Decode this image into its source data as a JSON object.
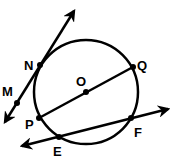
{
  "diagram": {
    "type": "circle-geometry",
    "circle": {
      "center": "O",
      "cx": 86,
      "cy": 92,
      "r": 52
    },
    "points": [
      {
        "id": "N",
        "label": "N",
        "x": 40,
        "y": 65,
        "lx": 24,
        "ly": 70
      },
      {
        "id": "M",
        "label": "M",
        "x": 17,
        "y": 103,
        "lx": 2,
        "ly": 96
      },
      {
        "id": "O",
        "label": "O",
        "x": 86,
        "y": 92,
        "lx": 76,
        "ly": 86
      },
      {
        "id": "Q",
        "label": "Q",
        "x": 133,
        "y": 67,
        "lx": 137,
        "ly": 70
      },
      {
        "id": "P",
        "label": "P",
        "x": 39,
        "y": 118,
        "lx": 25,
        "ly": 129
      },
      {
        "id": "E",
        "label": "E",
        "x": 59,
        "y": 137,
        "lx": 53,
        "ly": 156
      },
      {
        "id": "F",
        "label": "F",
        "x": 131,
        "y": 118,
        "lx": 134,
        "ly": 137
      }
    ],
    "segments": [
      {
        "name": "diameter-PQ",
        "from": "P",
        "to": "Q"
      }
    ],
    "lines": [
      {
        "name": "line-MN",
        "x1": 5,
        "y1": 122,
        "x2": 74,
        "y2": 11,
        "note": "secant through N, with M outside the circle"
      },
      {
        "name": "line-EF",
        "x1": 22,
        "y1": 146,
        "x2": 168,
        "y2": 109,
        "note": "secant through E and F"
      }
    ],
    "stroke_color": "#000000",
    "background": "#ffffff"
  }
}
